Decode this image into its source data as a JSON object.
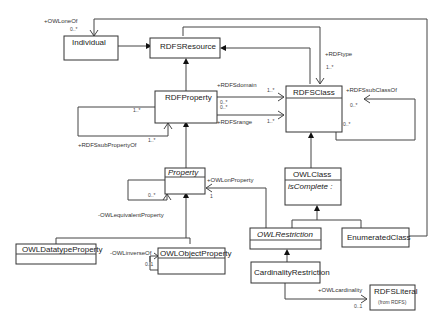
{
  "diagram": {
    "type": "UML class diagram",
    "classes": {
      "individual": {
        "name": "Individual"
      },
      "rdfs_resource": {
        "name": "RDFSResource"
      },
      "rdf_property": {
        "name": "RDFProperty"
      },
      "rdfs_class": {
        "name": "RDFSClass"
      },
      "property": {
        "name": "Property",
        "abstract": true
      },
      "owl_class": {
        "name": "OWLClass",
        "attribute": "isComplete :"
      },
      "owl_restriction": {
        "name": "OWLRestriction",
        "abstract": true
      },
      "enumerated_class": {
        "name": "EnumeratedClass"
      },
      "cardinality_restriction": {
        "name": "CardinalityRestriction"
      },
      "owl_datatype_property": {
        "name": "OWLDatatypeProperty"
      },
      "owl_object_property": {
        "name": "OWLObjectProperty"
      },
      "rdfs_literal": {
        "name": "RDFSLiteral",
        "stereotype": "(from RDFS)"
      }
    },
    "associations": {
      "owl_one_of": {
        "label": "+OWLoneOf",
        "mult": "0..*"
      },
      "rdf_type": {
        "label": "+RDFtype",
        "mult": "1..*"
      },
      "rdfs_domain": {
        "label": "+RDFSdomain",
        "mult_src": "0..*",
        "mult_dst": "1..*"
      },
      "rdfs_range": {
        "label": "+RDFSrange",
        "mult_src": "0..*",
        "mult_dst": "1..*"
      },
      "rdfs_sub_class_of": {
        "label": "+RDFSsubClassOf",
        "mult_a": "0..*",
        "mult_b": "0..*"
      },
      "rdfs_sub_property_of": {
        "label": "+RDFSsubPropertyOf",
        "mult_a": "1..*",
        "mult_b": "1..*"
      },
      "owl_on_property": {
        "label": "+OWLonProperty",
        "mult": "1"
      },
      "owl_equivalent_property": {
        "label": "-OWLequivalentProperty",
        "mult": "0..*"
      },
      "owl_inverse_of": {
        "label": "-OWLinverseOf",
        "mult": "0..1"
      },
      "owl_cardinality": {
        "label": "+OWLcardinality",
        "mult": "0..1"
      }
    }
  }
}
